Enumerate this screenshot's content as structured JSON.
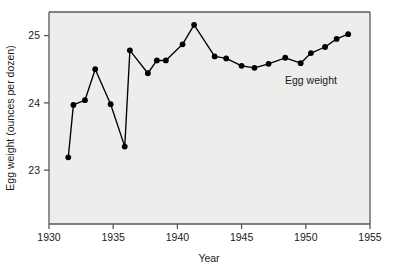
{
  "chart_data": {
    "type": "line",
    "title": "",
    "xlabel": "Year",
    "ylabel": "Egg weight (ounces per dozen)",
    "xlim": [
      1930,
      1955
    ],
    "ylim": [
      22.2,
      25.35
    ],
    "xticks": [
      1930,
      1935,
      1940,
      1945,
      1950,
      1955
    ],
    "xticklabels": [
      "1930",
      "1935",
      "1940",
      "1945",
      "1950",
      "1955"
    ],
    "yticks": [
      23,
      24,
      25
    ],
    "yticklabels": [
      "23",
      "24",
      "25"
    ],
    "grid": false,
    "legend_position": "inline-annotation",
    "annotations": [
      {
        "text": "Egg weight",
        "x": 1950.4,
        "y": 24.28
      }
    ],
    "series": [
      {
        "name": "Egg weight",
        "marker": "filled-circle",
        "color": "#000000",
        "x": [
          1931.5,
          1931.9,
          1932.8,
          1933.6,
          1934.8,
          1935.9,
          1936.3,
          1937.7,
          1938.4,
          1939.1,
          1940.4,
          1941.3,
          1942.9,
          1943.8,
          1945.0,
          1946.0,
          1947.1,
          1948.4,
          1949.6,
          1950.4,
          1951.5,
          1952.4,
          1953.3
        ],
        "y": [
          23.19,
          23.97,
          24.04,
          24.5,
          23.98,
          23.35,
          24.78,
          24.44,
          24.63,
          24.63,
          24.87,
          25.16,
          24.69,
          24.66,
          24.55,
          24.52,
          24.58,
          24.67,
          24.59,
          24.74,
          24.83,
          24.95,
          25.02
        ]
      }
    ]
  },
  "axes": {
    "x_axis_title": "Year",
    "y_axis_title": "Egg weight (ounces per dozen)"
  },
  "colors": {
    "plot_background": "#ededec",
    "axis": "#58585a",
    "data": "#000000",
    "text": "#1a1a1a"
  }
}
